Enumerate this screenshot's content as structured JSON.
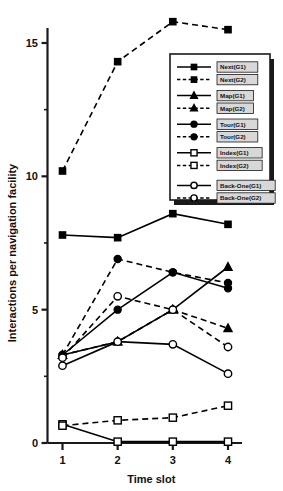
{
  "chart_data": {
    "type": "line",
    "title": "",
    "xlabel": "Time slot",
    "ylabel": "Interactions per navigation facility",
    "x": [
      1,
      2,
      3,
      4
    ],
    "xticklabels": [
      "1",
      "2",
      "3",
      "4"
    ],
    "yticklabels": [
      "0",
      "5",
      "10",
      "15"
    ],
    "ytickvalues": [
      0,
      5,
      10,
      15
    ],
    "ylim": [
      0,
      16.6
    ],
    "xlim": [
      0.6,
      4.45
    ],
    "grid": false,
    "legend_position": "upper-right-inside",
    "series": [
      {
        "name": "Next(G1)",
        "label": "Next(G1)",
        "marker": "filled-square",
        "linestyle": "solid",
        "values": [
          7.8,
          7.7,
          8.6,
          8.2
        ]
      },
      {
        "name": "Next(G2)",
        "label": "Next(G2)",
        "marker": "filled-square",
        "linestyle": "dashed",
        "values": [
          10.2,
          14.3,
          15.8,
          15.5
        ]
      },
      {
        "name": "Map(G1)",
        "label": "Map(G1)",
        "marker": "filled-triangle",
        "linestyle": "solid",
        "values": [
          3.3,
          3.8,
          5.0,
          6.6
        ]
      },
      {
        "name": "Map(G2)",
        "label": "Map(G2)",
        "marker": "filled-triangle",
        "linestyle": "dashed",
        "values": [
          3.3,
          3.8,
          5.0,
          4.3
        ]
      },
      {
        "name": "Tour(G1)",
        "label": "Tour(G1)",
        "marker": "filled-circle",
        "linestyle": "solid",
        "values": [
          3.3,
          5.0,
          6.4,
          5.8
        ]
      },
      {
        "name": "Tour(G2)",
        "label": "Tour(G2)",
        "marker": "filled-circle",
        "linestyle": "dashed",
        "values": [
          3.3,
          6.9,
          6.4,
          6.0
        ]
      },
      {
        "name": "Index(G1)",
        "label": "Index(G1)",
        "marker": "open-square",
        "linestyle": "solid",
        "values": [
          0.7,
          0.05,
          0.05,
          0.05
        ]
      },
      {
        "name": "Index(G2)",
        "label": "Index(G2)",
        "marker": "open-square",
        "linestyle": "dashed",
        "values": [
          0.65,
          0.85,
          0.95,
          1.4
        ]
      },
      {
        "name": "Back-One(G1)",
        "label": "Back-One(G1)",
        "marker": "open-circle",
        "linestyle": "solid",
        "values": [
          2.9,
          3.8,
          3.7,
          2.6
        ]
      },
      {
        "name": "Back-One(G2)",
        "label": "Back-One(G2)",
        "marker": "open-circle",
        "linestyle": "dashed",
        "values": [
          3.2,
          5.5,
          5.0,
          3.6
        ]
      }
    ]
  }
}
